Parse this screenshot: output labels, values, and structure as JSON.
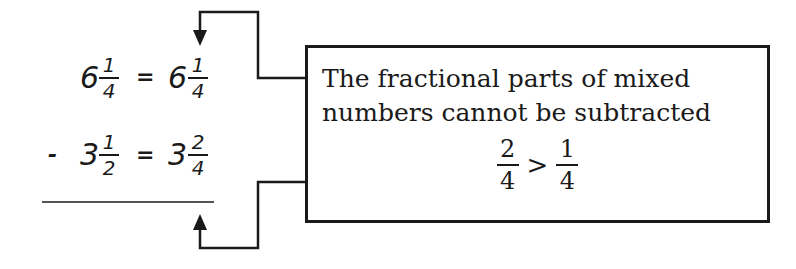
{
  "problem": {
    "row1": {
      "left_whole": "6",
      "left_num": "1",
      "left_den": "4",
      "equals": "=",
      "right_whole": "6",
      "right_num": "1",
      "right_den": "4"
    },
    "row2": {
      "operator": "-",
      "left_whole": "3",
      "left_num": "1",
      "left_den": "2",
      "equals": "=",
      "right_whole": "3",
      "right_num": "2",
      "right_den": "4"
    }
  },
  "callout": {
    "line1": "The fractional parts of mixed",
    "line2": "numbers cannot be subtracted",
    "comparison": {
      "left_num": "2",
      "left_den": "4",
      "symbol": ">",
      "right_num": "1",
      "right_den": "4"
    }
  },
  "colors": {
    "ink": "#1a1a1a",
    "background": "#ffffff"
  }
}
